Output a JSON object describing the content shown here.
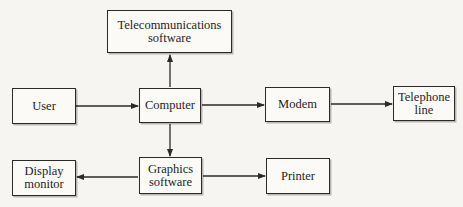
{
  "diagram": {
    "type": "block-flow",
    "nodes": [
      {
        "id": "telecom",
        "lines": [
          "Telecommunications",
          "software"
        ]
      },
      {
        "id": "user",
        "lines": [
          "User"
        ]
      },
      {
        "id": "computer",
        "lines": [
          "Computer"
        ]
      },
      {
        "id": "modem",
        "lines": [
          "Modem"
        ]
      },
      {
        "id": "telephone",
        "lines": [
          "Telephone",
          "line"
        ]
      },
      {
        "id": "display",
        "lines": [
          "Display",
          "monitor"
        ]
      },
      {
        "id": "graphics",
        "lines": [
          "Graphics",
          "software"
        ]
      },
      {
        "id": "printer",
        "lines": [
          "Printer"
        ]
      }
    ],
    "edges": [
      {
        "from": "user",
        "to": "computer"
      },
      {
        "from": "computer",
        "to": "telecom"
      },
      {
        "from": "computer",
        "to": "modem"
      },
      {
        "from": "modem",
        "to": "telephone"
      },
      {
        "from": "computer",
        "to": "graphics"
      },
      {
        "from": "graphics",
        "to": "display"
      },
      {
        "from": "graphics",
        "to": "printer"
      }
    ],
    "colors": {
      "line": "#2a2a2a",
      "background": "#f6f5f2",
      "box_fill": "#fbfaf7"
    }
  }
}
